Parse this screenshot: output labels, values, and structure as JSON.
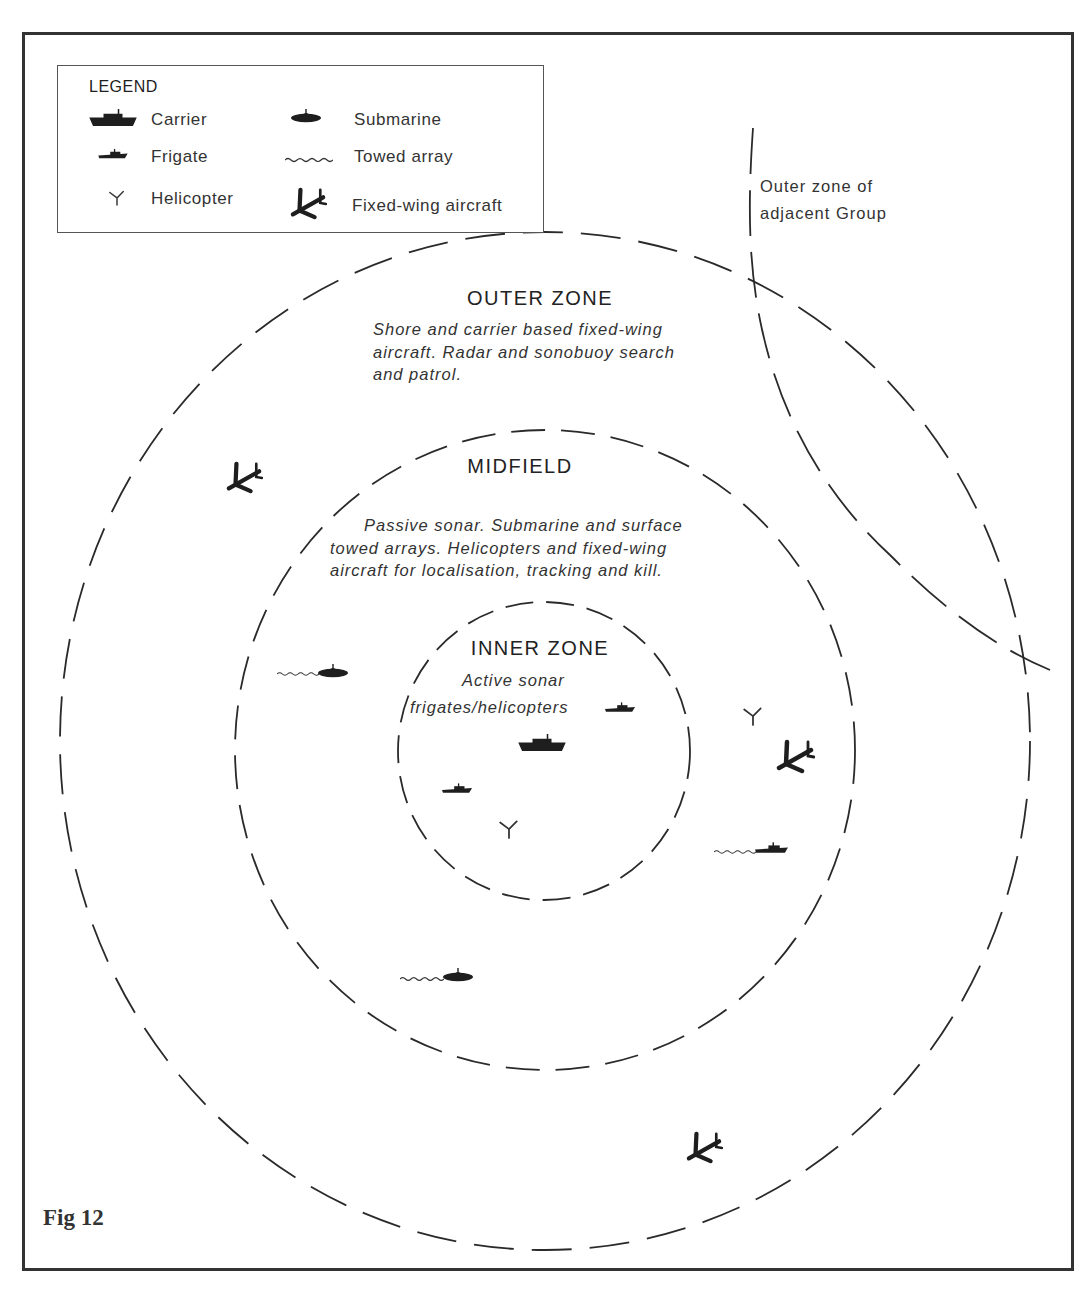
{
  "figure": {
    "label": "Fig 12"
  },
  "legend": {
    "title": "LEGEND",
    "items": [
      {
        "icon": "carrier-icon",
        "label": "Carrier"
      },
      {
        "icon": "submarine-icon",
        "label": "Submarine"
      },
      {
        "icon": "frigate-icon",
        "label": "Frigate"
      },
      {
        "icon": "towed-array-icon",
        "label": "Towed array"
      },
      {
        "icon": "helicopter-icon",
        "label": "Helicopter"
      },
      {
        "icon": "fixed-wing-aircraft-icon",
        "label": "Fixed-wing aircraft"
      }
    ]
  },
  "zones": {
    "outer": {
      "title": "OUTER ZONE",
      "description_lines": [
        "Shore and carrier based fixed-wing",
        "aircraft. Radar and sonobuoy search",
        "and patrol."
      ]
    },
    "midfield": {
      "title": "MIDFIELD",
      "description_lines": [
        "Passive sonar. Submarine and surface",
        "towed arrays. Helicopters and fixed-wing",
        "aircraft for localisation, tracking and kill."
      ]
    },
    "inner": {
      "title": "INNER ZONE",
      "description_lines": [
        "Active sonar",
        "frigates/helicopters"
      ]
    }
  },
  "adjacent_group": {
    "label_lines": [
      "Outer zone of",
      "adjacent Group"
    ]
  },
  "units": [
    {
      "type": "carrier",
      "zone": "inner"
    },
    {
      "type": "frigate",
      "zone": "inner"
    },
    {
      "type": "frigate",
      "zone": "inner"
    },
    {
      "type": "helicopter",
      "zone": "inner"
    },
    {
      "type": "submarine-with-towed-array",
      "zone": "midfield"
    },
    {
      "type": "submarine-with-towed-array",
      "zone": "midfield"
    },
    {
      "type": "frigate-with-towed-array",
      "zone": "midfield"
    },
    {
      "type": "helicopter",
      "zone": "midfield"
    },
    {
      "type": "fixed-wing-aircraft",
      "zone": "midfield"
    },
    {
      "type": "fixed-wing-aircraft",
      "zone": "outer"
    },
    {
      "type": "fixed-wing-aircraft",
      "zone": "outer"
    }
  ],
  "colors": {
    "ink": "#1e1e1e",
    "frame": "#333333",
    "background": "#ffffff"
  }
}
